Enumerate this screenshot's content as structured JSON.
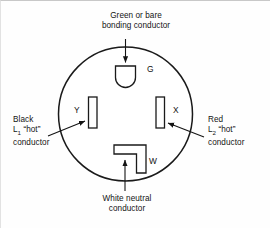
{
  "diagram": {
    "title_alt": "NEMA 14 style receptacle face wiring identification",
    "stroke_color": "#1a1a1a",
    "fill_color": "#ffffff",
    "background": "#fefefe",
    "receptacle": {
      "center_x": 124.5,
      "center_y": 113,
      "radius": 67
    },
    "labels": {
      "ground": {
        "line1": "Green or bare",
        "line2": "bonding conductor"
      },
      "left_hot": {
        "line1": "Black",
        "line2_prefix": "L",
        "line2_sub": "1",
        "line2_suffix": " “hot”",
        "line3": "conductor"
      },
      "right_hot": {
        "line1": "Red",
        "line2_prefix": "L",
        "line2_sub": "2",
        "line2_suffix": " “hot”",
        "line3": "conductor"
      },
      "neutral": {
        "line1": "White neutral",
        "line2": "conductor"
      }
    },
    "slots": [
      {
        "id": "G",
        "label": "G",
        "role": "grounding",
        "shape": "u-shaped"
      },
      {
        "id": "Y",
        "label": "Y",
        "role": "left-hot",
        "shape": "vertical-rectangle"
      },
      {
        "id": "X",
        "label": "X",
        "role": "right-hot",
        "shape": "vertical-rectangle"
      },
      {
        "id": "W",
        "label": "W",
        "role": "neutral",
        "shape": "l-shaped"
      }
    ]
  }
}
